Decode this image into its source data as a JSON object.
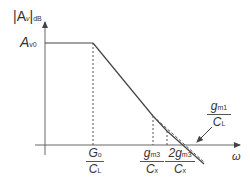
{
  "diagram": {
    "type": "bode-magnitude-plot",
    "y_axis_label": {
      "main": "|A",
      "sub_v": "v",
      "close": "|",
      "sub_db": "dB"
    },
    "x_axis_label": "ω",
    "dc_gain_label": {
      "main": "A",
      "sub": "v0"
    },
    "breakpoints": [
      {
        "num": "G",
        "num_sub": "o",
        "den": "C",
        "den_sub": "L"
      },
      {
        "num": "g",
        "num_sub": "m3",
        "den": "C",
        "den_sub": "x"
      },
      {
        "num": "2g",
        "num_sub": "m3",
        "den": "C",
        "den_sub": "x"
      }
    ],
    "annotation": {
      "num": "g",
      "num_sub": "m1",
      "den": "C",
      "den_sub": "L"
    },
    "colors": {
      "axis": "#555555",
      "curve": "#444444",
      "text": "#333333"
    }
  }
}
